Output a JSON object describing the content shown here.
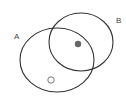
{
  "diagram": {
    "type": "venn",
    "sets": [
      {
        "id": "A",
        "label": "A",
        "cx": 57,
        "cy": 60,
        "rx": 37,
        "ry": 32,
        "label_x": 14,
        "label_y": 39
      },
      {
        "id": "B",
        "label": "B",
        "cx": 81,
        "cy": 42,
        "rx": 32,
        "ry": 29,
        "label_x": 116,
        "label_y": 23
      }
    ],
    "points": [
      {
        "kind": "filled",
        "region": "A∩B",
        "cx": 78,
        "cy": 44,
        "r": 3.2
      },
      {
        "kind": "open",
        "region": "A only",
        "cx": 51,
        "cy": 80,
        "r": 3.2
      }
    ],
    "colors": {
      "stroke": "#333333",
      "filled_point": "#666666",
      "open_point_stroke": "#777777",
      "label": "#444444",
      "background": "#ffffff"
    }
  }
}
